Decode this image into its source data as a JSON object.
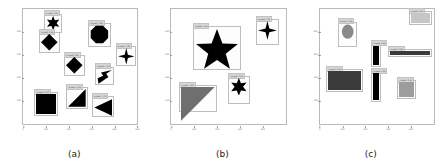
{
  "figure": {
    "background": "#ffffff",
    "box_border_color": "#bdbdbd",
    "label_bg_color": "#d6d6d6",
    "shape_black": "#000000",
    "shape_gray": "#6f6f6f"
  },
  "chart_data": {
    "type": "scatter",
    "title": "",
    "xlabel": "",
    "ylabel": "",
    "grid": false,
    "legend": "none",
    "panels": [
      {
        "caption": "(a)",
        "xlim": [
          0,
          500
        ],
        "ylim": [
          0,
          500
        ],
        "xticks": [
          "0",
          "100",
          "200",
          "300",
          "400",
          "500"
        ],
        "yticks": [
          "100",
          "200",
          "300",
          "400"
        ],
        "detections": [
          {
            "label": "shape6 : 0.92",
            "shape": "star6",
            "color": "#000000",
            "x": 18,
            "y": 4,
            "w": 16,
            "h": 17
          },
          {
            "label": "shape4 : 0.88",
            "shape": "diamond",
            "color": "#000000",
            "x": 14,
            "y": 20,
            "w": 18,
            "h": 18
          },
          {
            "label": "shape8 : 0.95",
            "shape": "octagon",
            "color": "#000000",
            "x": 57,
            "y": 12,
            "w": 20,
            "h": 21
          },
          {
            "label": "shape4 : 0.81",
            "shape": "star4",
            "color": "#000000",
            "x": 81,
            "y": 32,
            "w": 18,
            "h": 18
          },
          {
            "label": "shape3 : 0.74",
            "shape": "arrow",
            "color": "#000000",
            "x": 63,
            "y": 50,
            "w": 17,
            "h": 16
          },
          {
            "label": "shape4 : 0.90",
            "shape": "diamond",
            "color": "#000000",
            "x": 36,
            "y": 40,
            "w": 18,
            "h": 18
          },
          {
            "label": "shape4 : 0.97",
            "shape": "square",
            "color": "#000000",
            "x": 10,
            "y": 72,
            "w": 21,
            "h": 21
          },
          {
            "label": "shape3 : 0.86",
            "shape": "tri-lower-right",
            "color": "#000000",
            "x": 38,
            "y": 68,
            "w": 19,
            "h": 19
          },
          {
            "label": "shape3 : 0.79",
            "shape": "tri-left",
            "color": "#000000",
            "x": 60,
            "y": 76,
            "w": 20,
            "h": 18
          }
        ]
      },
      {
        "caption": "(b)",
        "xlim": [
          0,
          500
        ],
        "ylim": [
          0,
          500
        ],
        "xticks": [
          "0",
          "100",
          "200",
          "300",
          "400"
        ],
        "yticks": [
          "100",
          "200",
          "300",
          "400"
        ],
        "detections": [
          {
            "label": "shape5 : 0.99",
            "shape": "star5",
            "color": "#000000",
            "x": 19,
            "y": 15,
            "w": 42,
            "h": 38
          },
          {
            "label": "shape4 : 0.93",
            "shape": "star4",
            "color": "#000000",
            "x": 74,
            "y": 9,
            "w": 20,
            "h": 22
          },
          {
            "label": "shape6 : 0.91",
            "shape": "star6",
            "color": "#000000",
            "x": 50,
            "y": 58,
            "w": 19,
            "h": 25
          },
          {
            "label": "shape3 : 0.87",
            "shape": "tri-upper-left",
            "color": "#6f6f6f",
            "x": 7,
            "y": 66,
            "w": 33,
            "h": 24
          }
        ]
      },
      {
        "caption": "(c)",
        "xlim": [
          0,
          500
        ],
        "ylim": [
          0,
          500
        ],
        "xticks": [
          "0",
          "100",
          "200",
          "300",
          "400"
        ],
        "yticks": [
          "100",
          "200",
          "300",
          "400"
        ],
        "detections": [
          {
            "label": "shape0 : 0.94",
            "shape": "ellipse",
            "color": "#8a8a8a",
            "x": 16,
            "y": 11,
            "w": 17,
            "h": 22
          },
          {
            "label": "shape4 : 0.90",
            "shape": "rect",
            "color": "#c6c6c6",
            "x": 78,
            "y": 2,
            "w": 20,
            "h": 12
          },
          {
            "label": "shape4 : 0.96",
            "shape": "rect",
            "color": "#000000",
            "x": 45,
            "y": 30,
            "w": 9,
            "h": 20
          },
          {
            "label": "shape4 : 0.89",
            "shape": "rect",
            "color": "#3b3b3b",
            "x": 60,
            "y": 35,
            "w": 38,
            "h": 7
          },
          {
            "label": "shape4 : 0.98",
            "shape": "rect",
            "color": "#3b3b3b",
            "x": 6,
            "y": 52,
            "w": 32,
            "h": 20
          },
          {
            "label": "shape4 : 0.95",
            "shape": "rect",
            "color": "#000000",
            "x": 45,
            "y": 54,
            "w": 9,
            "h": 27
          },
          {
            "label": "shape4 : 0.83",
            "shape": "rect",
            "color": "#9d9d9d",
            "x": 68,
            "y": 62,
            "w": 16,
            "h": 16
          }
        ]
      }
    ]
  }
}
